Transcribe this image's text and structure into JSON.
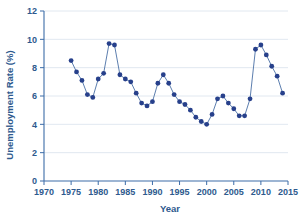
{
  "chart_data": {
    "type": "line",
    "title": "",
    "xlabel": "Year",
    "ylabel": "Unemployment Rate (%)",
    "xlim": [
      1970,
      2015
    ],
    "ylim": [
      0,
      12
    ],
    "xticks": [
      1970,
      1975,
      1980,
      1985,
      1990,
      1995,
      2000,
      2005,
      2010,
      2015
    ],
    "yticks": [
      0,
      2,
      4,
      6,
      8,
      10,
      12
    ],
    "grid": true,
    "legend": null,
    "marker": "filled-circle",
    "marker_color": "#27408B",
    "line_color": "#4A6FA5",
    "axis_color": "#2E5A8E",
    "grid_color": "#D9E2EC",
    "background": "#FFFFFF",
    "x": [
      1975,
      1976,
      1977,
      1978,
      1979,
      1980,
      1981,
      1982,
      1983,
      1984,
      1985,
      1986,
      1987,
      1988,
      1989,
      1990,
      1991,
      1992,
      1993,
      1994,
      1995,
      1996,
      1997,
      1998,
      1999,
      2000,
      2001,
      2002,
      2003,
      2004,
      2005,
      2006,
      2007,
      2008,
      2009,
      2010,
      2011,
      2012,
      2013,
      2014
    ],
    "values": [
      8.5,
      7.7,
      7.1,
      6.1,
      5.9,
      7.2,
      7.6,
      9.7,
      9.6,
      7.5,
      7.2,
      7.0,
      6.2,
      5.5,
      5.3,
      5.6,
      6.9,
      7.5,
      6.9,
      6.1,
      5.6,
      5.4,
      5.0,
      4.5,
      4.2,
      4.0,
      4.7,
      5.8,
      6.0,
      5.5,
      5.1,
      4.6,
      4.6,
      5.8,
      9.3,
      9.6,
      8.9,
      8.1,
      7.4,
      6.2
    ],
    "series": [
      {
        "name": "Unemployment Rate",
        "values": [
          8.5,
          7.7,
          7.1,
          6.1,
          5.9,
          7.2,
          7.6,
          9.7,
          9.6,
          7.5,
          7.2,
          7.0,
          6.2,
          5.5,
          5.3,
          5.6,
          6.9,
          7.5,
          6.9,
          6.1,
          5.6,
          5.4,
          5.0,
          4.5,
          4.2,
          4.0,
          4.7,
          5.8,
          6.0,
          5.5,
          5.1,
          4.6,
          4.6,
          5.8,
          9.3,
          9.6,
          8.9,
          8.1,
          7.4,
          6.2
        ]
      }
    ]
  }
}
